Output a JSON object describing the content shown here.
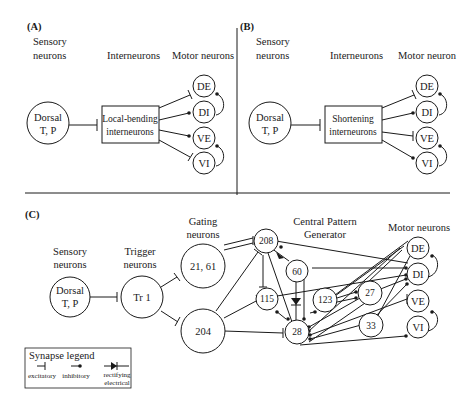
{
  "panels": {
    "A": {
      "label": "(A)",
      "columns": {
        "sensory_1": "Sensory",
        "sensory_2": "neurons",
        "inter": "Interneurons",
        "motor": "Motor neurons"
      },
      "sensory_node": {
        "line1": "Dorsal",
        "line2": "T, P"
      },
      "inter_box": {
        "line1": "Local-bending",
        "line2": "interneurons"
      },
      "motor_nodes": [
        "DE",
        "DI",
        "VE",
        "VI"
      ],
      "connections": [
        "excitatory→DE",
        "inhibitory→DI",
        "inhibitory→VE",
        "excitatory→VI"
      ]
    },
    "B": {
      "label": "(B)",
      "columns": {
        "sensory_1": "Sensory",
        "sensory_2": "neurons",
        "inter": "Interneurons",
        "motor": "Motor neuron"
      },
      "sensory_node": {
        "line1": "Dorsal",
        "line2": "T, P"
      },
      "inter_box": {
        "line1": "Shortening",
        "line2": "interneurons"
      },
      "motor_nodes": [
        "DE",
        "DI",
        "VE",
        "VI"
      ],
      "connections": [
        "excitatory→DE",
        "inhibitory→DI",
        "excitatory→VE",
        "inhibitory→VI"
      ]
    },
    "C": {
      "label": "(C)",
      "columns": {
        "sensory_1": "Sensory",
        "sensory_2": "neurons",
        "trigger_1": "Trigger",
        "trigger_2": "neurons",
        "gating_1": "Gating",
        "gating_2": "neurons",
        "cpg_1": "Central Pattern",
        "cpg_2": "Generator",
        "motor": "Motor neurons"
      },
      "nodes": {
        "sensory": {
          "line1": "Dorsal",
          "line2": "T, P"
        },
        "trigger": "Tr 1",
        "gating_a": "21, 61",
        "gating_b": "204",
        "n208": "208",
        "n60": "60",
        "n115": "115",
        "n123": "123",
        "n27": "27",
        "n28": "28",
        "n33": "33",
        "motor": [
          "DE",
          "DI",
          "VE",
          "VI"
        ]
      }
    }
  },
  "legend": {
    "title": "Synapse legend",
    "excitatory": "excitatory",
    "inhibitory": "inhibitory",
    "rectifying_1": "rectifying",
    "rectifying_2": "electrical"
  }
}
